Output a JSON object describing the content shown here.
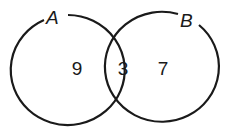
{
  "diagram": {
    "type": "venn",
    "sets": [
      {
        "label": "A",
        "only_count": "9"
      },
      {
        "label": "B",
        "only_count": "7"
      }
    ],
    "intersection_count": "3",
    "stroke_color": "#1a1a1a",
    "background_color": "#ffffff"
  }
}
